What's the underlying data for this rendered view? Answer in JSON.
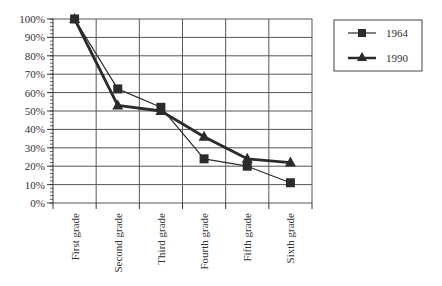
{
  "chart_data": {
    "type": "line",
    "title": "",
    "xlabel": "",
    "ylabel": "",
    "categories": [
      "First grade",
      "Second grade",
      "Third grade",
      "Fourth grade",
      "Fifth grade",
      "Sixth grade"
    ],
    "series": [
      {
        "name": "1964",
        "marker": "square",
        "line_width": "thin",
        "values": [
          100,
          62,
          52,
          24,
          20,
          11
        ]
      },
      {
        "name": "1990",
        "marker": "triangle",
        "line_width": "thick",
        "values": [
          100,
          53,
          50,
          36,
          24,
          22
        ]
      }
    ],
    "ylim": [
      0,
      100
    ],
    "yticks": [
      "0%",
      "10%",
      "20%",
      "30%",
      "40%",
      "50%",
      "60%",
      "70%",
      "80%",
      "90%",
      "100%"
    ],
    "grid": true,
    "legend_position": "top-right",
    "colors": {
      "line": "#2b2b2b",
      "grid": "#555555",
      "axis": "#333333"
    }
  }
}
